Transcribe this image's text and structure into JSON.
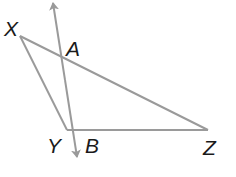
{
  "diagram": {
    "type": "geometry",
    "colors": {
      "line": "#9a9a9a",
      "label": "#1a1a1a",
      "background": "#ffffff"
    },
    "points": {
      "X": {
        "label": "X",
        "x": 20,
        "y": 36
      },
      "Y": {
        "label": "Y",
        "x": 67,
        "y": 130
      },
      "Z": {
        "label": "Z",
        "x": 208,
        "y": 130
      },
      "A": {
        "label": "A",
        "x": 62,
        "y": 58
      },
      "B": {
        "label": "B",
        "x": 74,
        "y": 130
      }
    },
    "segments": [
      {
        "from": "X",
        "to": "Y"
      },
      {
        "from": "Y",
        "to": "Z"
      },
      {
        "from": "X",
        "to": "Z"
      }
    ],
    "line": {
      "name": "line AB",
      "through": [
        "A",
        "B"
      ],
      "arrow_start": {
        "x": 53,
        "y": 2
      },
      "arrow_end": {
        "x": 77,
        "y": 158
      },
      "arrows_both_ends": true
    },
    "labels": [
      {
        "text": "X",
        "left": 4,
        "top": 18
      },
      {
        "text": "A",
        "left": 66,
        "top": 38
      },
      {
        "text": "Y",
        "left": 47,
        "top": 135
      },
      {
        "text": "B",
        "left": 85,
        "top": 135
      },
      {
        "text": "Z",
        "left": 203,
        "top": 137
      }
    ]
  }
}
